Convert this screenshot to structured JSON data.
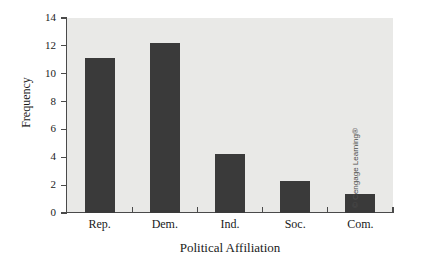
{
  "chart_data": {
    "type": "bar",
    "title": "",
    "categories": [
      "Rep.",
      "Dem.",
      "Ind.",
      "Soc.",
      "Com."
    ],
    "values": [
      11.1,
      12.2,
      4.25,
      2.3,
      1.35
    ],
    "xlabel": "Political Affiliation",
    "ylabel": "Frequency",
    "ylim": [
      0,
      14
    ],
    "yticks": [
      0,
      2,
      4,
      6,
      8,
      10,
      12,
      14
    ],
    "ytick_labels": [
      "0",
      "2",
      "4",
      "6",
      "8",
      "10",
      "12",
      "14"
    ],
    "grid": false,
    "legend": null,
    "bar_color": "#3a3a3a",
    "plot_background": "#e9e9e7",
    "axis_color": "#4a4a4a"
  },
  "attribution": {
    "text": "© Cengage Learning®"
  }
}
